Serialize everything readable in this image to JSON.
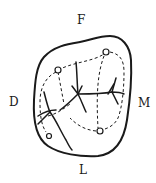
{
  "diagram": {
    "type": "tooth-occlusal-surface",
    "labels": {
      "top": "F",
      "left": "D",
      "right": "M",
      "bottom": "L"
    },
    "colors": {
      "stroke": "#1a1a1a",
      "background": "#ffffff"
    }
  }
}
